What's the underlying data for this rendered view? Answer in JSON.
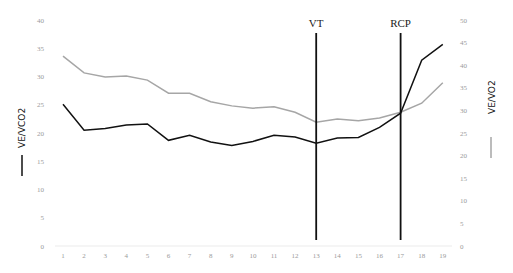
{
  "chart_data": {
    "type": "line",
    "title": "",
    "x": [
      1,
      2,
      3,
      4,
      5,
      6,
      7,
      8,
      9,
      10,
      11,
      12,
      13,
      14,
      15,
      16,
      17,
      18,
      19
    ],
    "xlabel": "",
    "series": [
      {
        "name": "VE/VCO2",
        "axis": "left",
        "color": "#111111",
        "values": [
          25.1,
          20.5,
          20.8,
          21.4,
          21.6,
          18.7,
          19.6,
          18.4,
          17.8,
          18.5,
          19.6,
          19.3,
          18.2,
          19.1,
          19.2,
          21.0,
          23.5,
          32.9,
          35.7
        ]
      },
      {
        "name": "VE/VO2",
        "axis": "right",
        "color": "#a6a6a6",
        "values": [
          42.0,
          38.3,
          37.4,
          37.6,
          36.7,
          33.8,
          33.8,
          31.9,
          31.0,
          30.5,
          30.8,
          29.6,
          27.4,
          28.1,
          27.7,
          28.3,
          29.6,
          31.6,
          36.1
        ]
      }
    ],
    "ylabel_left": "VE/VCO2",
    "ylabel_right": "VE/VO2",
    "ylim_left": [
      0,
      40
    ],
    "ylim_right": [
      0,
      50
    ],
    "yticks_left": [
      "0",
      "5",
      "10",
      "15",
      "20",
      "25",
      "30",
      "35",
      "40"
    ],
    "yticks_right": [
      "0",
      "5",
      "10",
      "15",
      "20",
      "25",
      "30",
      "35",
      "40",
      "45",
      "50"
    ],
    "xticks": [
      "1",
      "2",
      "3",
      "4",
      "5",
      "6",
      "7",
      "8",
      "9",
      "10",
      "11",
      "12",
      "13",
      "14",
      "15",
      "16",
      "17",
      "18",
      "19"
    ],
    "annotations": [
      {
        "label": "VT",
        "x": 13
      },
      {
        "label": "RCP",
        "x": 17
      }
    ],
    "grid": false,
    "legend": "axis-title line swatches"
  }
}
